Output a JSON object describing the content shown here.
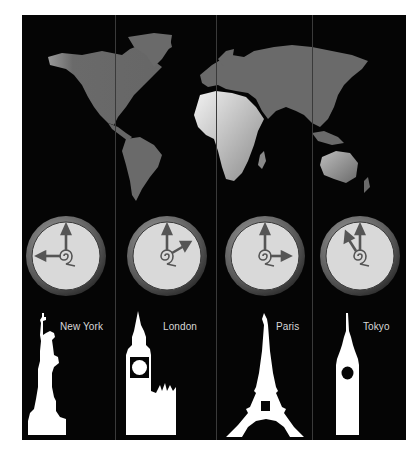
{
  "colors": {
    "background": "#050505",
    "map_land": "#6a6a6a",
    "clock_face": "#d9d9d9",
    "clock_rim": "#6e6e6e",
    "hands": "#555555",
    "landmark": "#ffffff",
    "label": "#d8d8d8"
  },
  "cities": [
    {
      "name": "New York",
      "landmark": "statue-of-liberty",
      "clock": {
        "hour": 9,
        "minute": 0
      }
    },
    {
      "name": "London",
      "landmark": "big-ben",
      "clock": {
        "hour": 2,
        "minute": 0
      }
    },
    {
      "name": "Paris",
      "landmark": "eiffel-tower",
      "clock": {
        "hour": 3,
        "minute": 0
      }
    },
    {
      "name": "Tokyo",
      "landmark": "tokyo-tower-skyscraper",
      "clock": {
        "hour": 11,
        "minute": 0
      }
    }
  ]
}
